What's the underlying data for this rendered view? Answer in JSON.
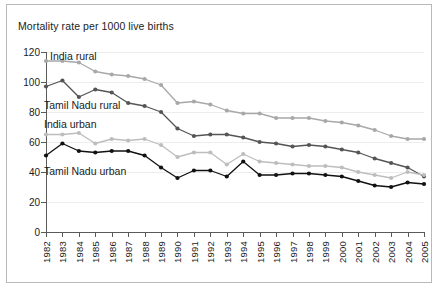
{
  "figure": {
    "title": "Mortality rate per 1000 live births",
    "border_color": "#b9b9b9",
    "background": "#ffffff"
  },
  "axes": {
    "y_ticks": [
      "0",
      "20",
      "40",
      "60",
      "80",
      "100",
      "120"
    ],
    "y_min": 0,
    "y_max": 120,
    "grid": true,
    "axis_color": "#5a5a5a",
    "grid_color": "#ededed"
  },
  "series_labels": {
    "india_rural": "India rural",
    "tamil_nadu_rural": "Tamil Nadu rural",
    "india_urban": "India urban",
    "tamil_nadu_urban": "Tamil Nadu urban"
  },
  "chart_data": {
    "type": "line",
    "title": "Mortality rate per 1000 live births",
    "xlabel": "",
    "ylabel": "Mortality rate per 1000 live births",
    "ylim": [
      0,
      120
    ],
    "ytick_values": [
      0,
      20,
      40,
      60,
      80,
      100,
      120
    ],
    "grid": true,
    "legend_position": "inline-labels",
    "x": [
      "1982",
      "1983",
      "1984",
      "1985",
      "1986",
      "1987",
      "1988",
      "1989",
      "1990",
      "1991",
      "1992",
      "1993",
      "1994",
      "1995",
      "1996",
      "1997",
      "1998",
      "1999",
      "2000",
      "2001",
      "2002",
      "2003",
      "2004",
      "2005"
    ],
    "series": [
      {
        "name": "India rural",
        "color": "#a8a8a8",
        "values": [
          114,
          114,
          113,
          107,
          105,
          104,
          102,
          98,
          86,
          87,
          85,
          81,
          79,
          79,
          76,
          76,
          76,
          74,
          73,
          71,
          68,
          64,
          62,
          62
        ]
      },
      {
        "name": "Tamil Nadu rural",
        "color": "#555555",
        "values": [
          97,
          101,
          90,
          95,
          93,
          86,
          84,
          80,
          69,
          64,
          65,
          65,
          63,
          60,
          59,
          57,
          58,
          57,
          55,
          53,
          49,
          46,
          43,
          37
        ]
      },
      {
        "name": "India urban",
        "color": "#bdbdbd",
        "values": [
          65,
          65,
          66,
          59,
          62,
          61,
          62,
          58,
          50,
          53,
          53,
          45,
          52,
          47,
          46,
          45,
          44,
          44,
          43,
          40,
          38,
          36,
          40,
          38
        ]
      },
      {
        "name": "Tamil Nadu urban",
        "color": "#111111",
        "values": [
          51,
          59,
          54,
          53,
          54,
          54,
          51,
          43,
          36,
          41,
          41,
          37,
          47,
          38,
          38,
          39,
          39,
          38,
          37,
          34,
          31,
          30,
          33,
          32
        ]
      }
    ]
  }
}
